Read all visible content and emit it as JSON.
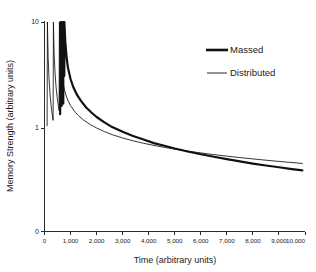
{
  "chart_data": {
    "type": "line",
    "title": "",
    "xlabel": "Time (arbitrary units)",
    "ylabel": "Memory Strength (arbitrary units)",
    "yscale": "log",
    "xscale": "linear",
    "xlim": [
      0,
      10000
    ],
    "ylim": [
      0.18,
      10
    ],
    "grid": false,
    "legend_position": "top-right",
    "xticks": [
      0,
      1000,
      2000,
      3000,
      4000,
      5000,
      6000,
      7000,
      8000,
      9000,
      10000
    ],
    "xticklabels": [
      "0",
      "1,000",
      "2,000",
      "3,000",
      "4,000",
      "5,000",
      "6,000",
      "7,000",
      "8,000",
      "9,000",
      "10,000"
    ],
    "yticks": [
      0,
      1,
      10
    ],
    "yticklabels": [
      "0",
      "1",
      "10"
    ],
    "series": [
      {
        "name": "Massed",
        "style": "thick",
        "color": "#111111",
        "learning_events_x": [
          600,
          660,
          720,
          760
        ],
        "points": [
          [
            600,
            1.35
          ],
          [
            612,
            10.0
          ],
          [
            624,
            5.1
          ],
          [
            636,
            3.2
          ],
          [
            648,
            2.2
          ],
          [
            660,
            1.62
          ],
          [
            662,
            10.0
          ],
          [
            674,
            5.4
          ],
          [
            686,
            3.5
          ],
          [
            698,
            2.5
          ],
          [
            710,
            1.95
          ],
          [
            720,
            1.7
          ],
          [
            722,
            10.0
          ],
          [
            734,
            6.0
          ],
          [
            746,
            4.2
          ],
          [
            758,
            3.2
          ],
          [
            760,
            3.1
          ],
          [
            762,
            10.0
          ],
          [
            800,
            6.4
          ],
          [
            850,
            4.6
          ],
          [
            900,
            3.7
          ],
          [
            1000,
            2.9
          ],
          [
            1100,
            2.45
          ],
          [
            1250,
            2.05
          ],
          [
            1400,
            1.8
          ],
          [
            1600,
            1.56
          ],
          [
            1800,
            1.4
          ],
          [
            2000,
            1.27
          ],
          [
            2300,
            1.13
          ],
          [
            2600,
            1.02
          ],
          [
            3000,
            0.92
          ],
          [
            3400,
            0.84
          ],
          [
            3800,
            0.78
          ],
          [
            4200,
            0.72
          ],
          [
            4600,
            0.68
          ],
          [
            5000,
            0.64
          ],
          [
            5500,
            0.6
          ],
          [
            6000,
            0.565
          ],
          [
            6500,
            0.535
          ],
          [
            7000,
            0.508
          ],
          [
            7500,
            0.484
          ],
          [
            8000,
            0.462
          ],
          [
            8500,
            0.443
          ],
          [
            9000,
            0.426
          ],
          [
            9500,
            0.41
          ],
          [
            9900,
            0.398
          ]
        ]
      },
      {
        "name": "Distributed",
        "style": "thin",
        "color": "#111111",
        "learning_events_x": [
          100,
          330,
          560
        ],
        "points": [
          [
            100,
            1.05
          ],
          [
            112,
            10.0
          ],
          [
            140,
            4.6
          ],
          [
            175,
            2.9
          ],
          [
            215,
            2.05
          ],
          [
            260,
            1.58
          ],
          [
            300,
            1.32
          ],
          [
            330,
            1.18
          ],
          [
            342,
            10.0
          ],
          [
            370,
            5.0
          ],
          [
            405,
            3.3
          ],
          [
            445,
            2.42
          ],
          [
            490,
            1.92
          ],
          [
            530,
            1.62
          ],
          [
            560,
            1.46
          ],
          [
            572,
            10.0
          ],
          [
            600,
            5.6
          ],
          [
            640,
            3.9
          ],
          [
            690,
            2.95
          ],
          [
            750,
            2.4
          ],
          [
            820,
            2.05
          ],
          [
            900,
            1.82
          ],
          [
            1000,
            1.63
          ],
          [
            1150,
            1.44
          ],
          [
            1300,
            1.31
          ],
          [
            1500,
            1.19
          ],
          [
            1750,
            1.08
          ],
          [
            2000,
            1.0
          ],
          [
            2300,
            0.925
          ],
          [
            2600,
            0.865
          ],
          [
            3000,
            0.805
          ],
          [
            3400,
            0.757
          ],
          [
            3800,
            0.718
          ],
          [
            4200,
            0.685
          ],
          [
            4600,
            0.657
          ],
          [
            5000,
            0.632
          ],
          [
            5500,
            0.605
          ],
          [
            6000,
            0.582
          ],
          [
            6500,
            0.561
          ],
          [
            7000,
            0.543
          ],
          [
            7500,
            0.526
          ],
          [
            8000,
            0.511
          ],
          [
            8500,
            0.497
          ],
          [
            9000,
            0.484
          ],
          [
            9500,
            0.472
          ],
          [
            9900,
            0.463
          ]
        ]
      }
    ]
  },
  "legend": {
    "items": [
      {
        "label": "Massed"
      },
      {
        "label": "Distributed"
      }
    ]
  }
}
